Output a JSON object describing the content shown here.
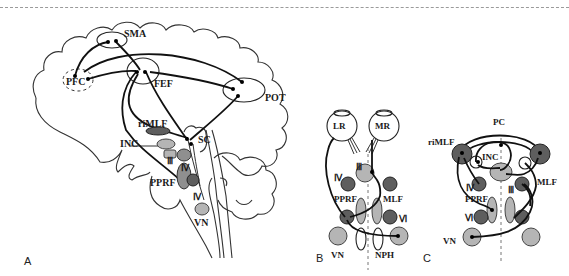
{
  "figure": {
    "panels": [
      {
        "id": "A",
        "label": "A",
        "description": "Sagittal brain view with cortical and brainstem saccade centers",
        "structures": {
          "sma": "SMA",
          "pfc": "PFC",
          "fef": "FEF",
          "pot": "POT",
          "rimlf": "riMLF",
          "inc": "INC",
          "sc": "SC",
          "iii": "Ⅲ",
          "iv_upper": "Ⅳ",
          "pprf": "PPRF",
          "iv_lower": "Ⅳ",
          "vn": "VN"
        }
      },
      {
        "id": "B",
        "label": "B",
        "description": "Horizontal gaze circuit schematic",
        "structures": {
          "lr": "LR",
          "mr": "MR",
          "iii": "Ⅲ",
          "iv": "Ⅳ",
          "pprf": "PPRF",
          "mlf": "MLF",
          "vi": "Ⅵ",
          "vn": "VN",
          "nph": "NPH"
        }
      },
      {
        "id": "C",
        "label": "C",
        "description": "Vertical gaze circuit schematic",
        "structures": {
          "pc": "PC",
          "rimlf": "riMLF",
          "inc": "INC",
          "iv": "Ⅳ",
          "pprf": "PPRF",
          "iii": "Ⅲ",
          "mlf": "MLF",
          "vi": "Ⅵ",
          "vn": "VN"
        }
      }
    ],
    "colors": {
      "light_nucleus": "#b5b5b5",
      "mid_nucleus": "#8f8f8f",
      "dark_nucleus": "#5e5e5e",
      "line": "#111111"
    }
  }
}
